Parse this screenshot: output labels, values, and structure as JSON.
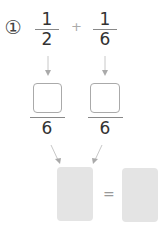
{
  "problem": {
    "number_label": "①",
    "fraction1": {
      "numerator": "1",
      "denominator": "2"
    },
    "operator": "+",
    "fraction2": {
      "numerator": "1",
      "denominator": "6"
    },
    "converted1": {
      "numerator": "",
      "denominator": "6"
    },
    "converted2": {
      "numerator": "",
      "denominator": "6"
    },
    "result_sum": "",
    "equals": "=",
    "result_simplified": ""
  },
  "colors": {
    "text": "#333333",
    "arrow": "#bbbbbb",
    "box_border": "#aaaaaa",
    "answer_fill": "#e4e4e4"
  }
}
